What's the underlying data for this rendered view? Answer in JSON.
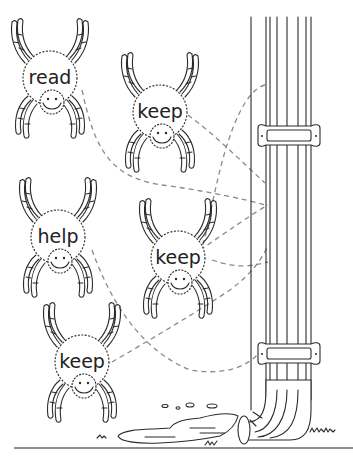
{
  "worksheet": {
    "type": "word-matching illustration",
    "spiders": [
      {
        "id": "spider-1",
        "word": "read",
        "cx": 50,
        "cy": 78
      },
      {
        "id": "spider-2",
        "word": "keep",
        "cx": 160,
        "cy": 112
      },
      {
        "id": "spider-3",
        "word": "help",
        "cx": 58,
        "cy": 237
      },
      {
        "id": "spider-4",
        "word": "keep",
        "cx": 178,
        "cy": 258
      },
      {
        "id": "spider-5",
        "word": "keep",
        "cx": 82,
        "cy": 362
      }
    ],
    "target": {
      "name": "drainpipe",
      "label": ""
    },
    "colors": {
      "ink": "#2a2a2a",
      "dashed_line": "#8a8a8a",
      "background": "#ffffff"
    }
  }
}
